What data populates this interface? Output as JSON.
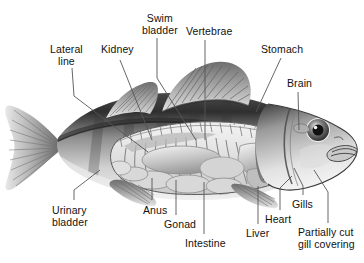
{
  "figure": {
    "style": "grayscale-airbrush-illustration",
    "background_color": "#ffffff",
    "label_color": "#111111",
    "leader_line_color": "#555555"
  },
  "labels": [
    {
      "id": "lateral-line",
      "text": "Lateral\nline",
      "x": 50,
      "y": 44,
      "align": "center"
    },
    {
      "id": "kidney",
      "text": "Kidney",
      "x": 101,
      "y": 44,
      "align": "left"
    },
    {
      "id": "swim-bladder",
      "text": "Swim\nbladder",
      "x": 142,
      "y": 13,
      "align": "center"
    },
    {
      "id": "vertebrae",
      "text": "Vertebrae",
      "x": 186,
      "y": 26,
      "align": "left"
    },
    {
      "id": "stomach",
      "text": "Stomach",
      "x": 261,
      "y": 44,
      "align": "left"
    },
    {
      "id": "brain",
      "text": "Brain",
      "x": 287,
      "y": 78,
      "align": "left"
    },
    {
      "id": "urinary-bladder",
      "text": "Urinary\nbladder",
      "x": 52,
      "y": 205,
      "align": "left"
    },
    {
      "id": "anus",
      "text": "Anus",
      "x": 143,
      "y": 205,
      "align": "left"
    },
    {
      "id": "gonad",
      "text": "Gonad",
      "x": 164,
      "y": 219,
      "align": "left"
    },
    {
      "id": "intestine",
      "text": "Intestine",
      "x": 185,
      "y": 238,
      "align": "left"
    },
    {
      "id": "liver",
      "text": "Liver",
      "x": 246,
      "y": 228,
      "align": "left"
    },
    {
      "id": "heart",
      "text": "Heart",
      "x": 265,
      "y": 214,
      "align": "left"
    },
    {
      "id": "gills",
      "text": "Gills",
      "x": 292,
      "y": 199,
      "align": "left"
    },
    {
      "id": "partially-cut-gill-covering",
      "text": "Partially cut\ngill covering",
      "x": 298,
      "y": 227,
      "align": "left"
    }
  ],
  "leaders": [
    {
      "id": "leader-lateral-line",
      "points": "72,68 74,96 148,152"
    },
    {
      "id": "leader-kidney",
      "points": "120,60 152,140"
    },
    {
      "id": "leader-swim-bladder",
      "points": "157,38 157,78 196,140"
    },
    {
      "id": "leader-vertebrae",
      "points": "205,40 205,140"
    },
    {
      "id": "leader-stomach",
      "points": "281,58 256,112"
    },
    {
      "id": "leader-brain",
      "points": "298,92 299,130"
    },
    {
      "id": "leader-urinary-bladder",
      "points": "74,200 74,190 100,170"
    },
    {
      "id": "leader-anus",
      "points": "152,200 152,178"
    },
    {
      "id": "leader-gonad",
      "points": "176,215 176,180"
    },
    {
      "id": "leader-intestine",
      "points": "204,234 204,182"
    },
    {
      "id": "leader-liver",
      "points": "258,224 258,186"
    },
    {
      "id": "leader-heart",
      "points": "280,210 280,188 292,176"
    },
    {
      "id": "leader-gills",
      "points": "303,195 303,186 294,168"
    },
    {
      "id": "leader-gill-covering",
      "points": "328,223 328,192 314,170"
    }
  ],
  "anatomy_parts": [
    "tail-fin",
    "caudal-peduncle",
    "body",
    "lateral-line-stripe",
    "first-dorsal-fin",
    "second-dorsal-fin",
    "anal-fin",
    "pelvic-fin",
    "vertebral-column",
    "ribs",
    "swim-bladder",
    "kidney",
    "stomach",
    "intestine",
    "gonad",
    "liver",
    "heart",
    "gills",
    "gill-cover",
    "brain",
    "eye",
    "mouth"
  ]
}
